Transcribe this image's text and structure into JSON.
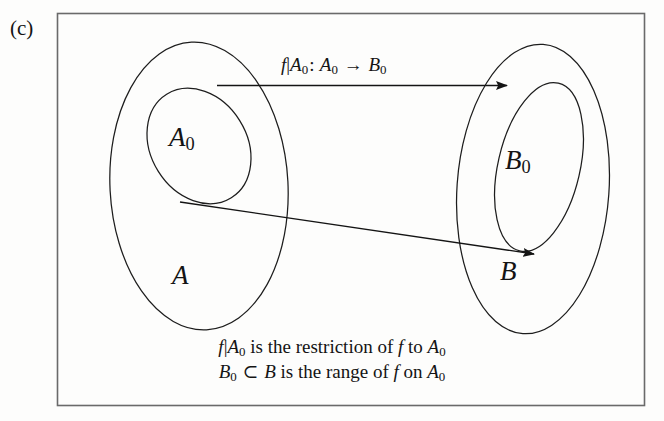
{
  "figure": {
    "panel_tag": "(c)",
    "border_color": "#555555",
    "stroke_color": "#1d1d1d",
    "background": "#fdfdfc"
  },
  "sets": {
    "domain_outer": {
      "name": "A",
      "label_base": "A",
      "label_sub": "",
      "icon": "ellipse-outline"
    },
    "domain_inner": {
      "name": "A0",
      "label_base": "A",
      "label_sub": "0",
      "icon": "ellipse-outline"
    },
    "codomain_outer": {
      "name": "B",
      "label_base": "B",
      "label_sub": "",
      "icon": "ellipse-outline"
    },
    "codomain_inner": {
      "name": "B0",
      "label_base": "B",
      "label_sub": "0",
      "icon": "ellipse-outline"
    }
  },
  "arrows": {
    "restriction_arrow": {
      "icon": "arrow-right-icon",
      "label": {
        "fn": "f",
        "bar": "|",
        "restrict_base": "A",
        "restrict_sub": "0",
        "colon": ":",
        "source_base": "A",
        "source_sub": "0",
        "maps_to": "→",
        "target_base": "B",
        "target_sub": "0"
      }
    },
    "element_arrow": {
      "icon": "arrow-right-icon"
    }
  },
  "caption": {
    "line1": {
      "fn": "f",
      "bar": "|",
      "restrict_base": "A",
      "restrict_sub": "0",
      "text_a": "is the restriction of",
      "fn2": "f",
      "text_b": "to",
      "target_base": "A",
      "target_sub": "0"
    },
    "line2": {
      "sub_base": "B",
      "sub_sub": "0",
      "subset": "⊂",
      "super_base": "B",
      "text_a": "is the range of",
      "fn": "f",
      "text_b": "on",
      "target_base": "A",
      "target_sub": "0"
    }
  }
}
